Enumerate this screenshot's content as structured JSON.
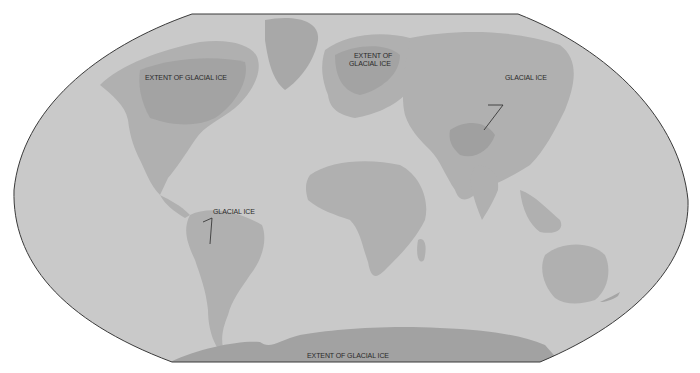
{
  "map": {
    "projection": "world-oval",
    "colors": {
      "background": "#ffffff",
      "ocean": "#c9c9c9",
      "land": "#afafaf",
      "ice": "#a2a2a2",
      "outline": "#3a3a3a",
      "label": "#2a2a2a"
    },
    "labels": [
      {
        "id": "north-america-ice",
        "text": "EXTENT OF GLACIAL ICE"
      },
      {
        "id": "europe-ice-line1",
        "text": "EXTENT OF"
      },
      {
        "id": "europe-ice-line2",
        "text": "GLACIAL ICE"
      },
      {
        "id": "asia-ice",
        "text": "GLACIAL ICE"
      },
      {
        "id": "south-america-ice",
        "text": "GLACIAL ICE"
      },
      {
        "id": "antarctica-ice",
        "text": "EXTENT OF GLACIAL ICE"
      }
    ]
  }
}
